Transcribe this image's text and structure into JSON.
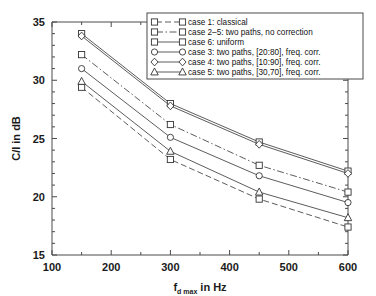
{
  "chart_data": {
    "type": "line",
    "title": "",
    "xlabel": "f_d max in Hz",
    "xlabel_main": "f",
    "xlabel_sub": "d max",
    "xlabel_tail": " in Hz",
    "ylabel": "C/I in dB",
    "x": [
      150,
      300,
      450,
      600
    ],
    "xlim": [
      100,
      600
    ],
    "ylim": [
      15,
      35
    ],
    "xticks": [
      100,
      200,
      300,
      400,
      500,
      600
    ],
    "yticks": [
      15,
      20,
      25,
      30,
      35
    ],
    "xtick_labels": [
      "100",
      "200",
      "300",
      "400",
      "500",
      "600"
    ],
    "ytick_labels": [
      "15",
      "20",
      "25",
      "30",
      "35"
    ],
    "grid": false,
    "legend_position": "top-right",
    "series": [
      {
        "name": "case 1: classical",
        "marker": "square",
        "linestyle": "dashed",
        "values": [
          29.4,
          23.2,
          19.8,
          17.4
        ]
      },
      {
        "name": "case 2–5: two paths, no correction",
        "marker": "square",
        "linestyle": "dashdot",
        "values": [
          32.2,
          26.2,
          22.7,
          20.4
        ]
      },
      {
        "name": "case 6: uniform",
        "marker": "square",
        "linestyle": "solid",
        "values": [
          34.0,
          28.0,
          24.7,
          22.2
        ]
      },
      {
        "name": "case 3: two paths, [20:80], freq. corr.",
        "marker": "circle",
        "linestyle": "solid",
        "values": [
          31.0,
          25.1,
          21.8,
          19.5
        ]
      },
      {
        "name": "case 4: two paths, [10:90], freq. corr.",
        "marker": "diamond",
        "linestyle": "solid",
        "values": [
          33.8,
          27.8,
          24.5,
          22.0
        ]
      },
      {
        "name": "case 5: two paths, [30,70], freq. corr.",
        "marker": "triangle",
        "linestyle": "solid",
        "values": [
          29.9,
          23.9,
          20.4,
          18.2
        ]
      }
    ]
  },
  "colors": {
    "axis": "#4a4a4a",
    "line": "#4a4a4a",
    "marker_face": "#ffffff",
    "marker_edge": "#333333",
    "text": "#111111",
    "background": "#ffffff"
  }
}
